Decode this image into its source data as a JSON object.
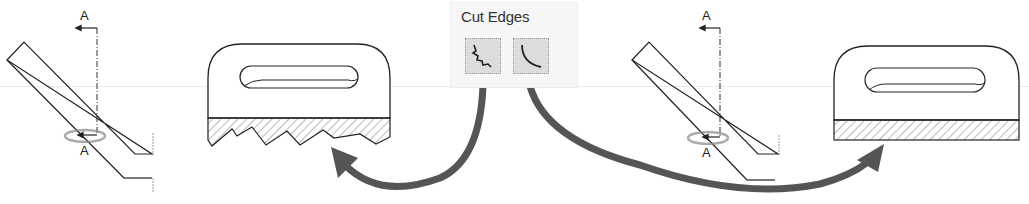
{
  "panel": {
    "title": "Cut Edges",
    "buttons": [
      {
        "name": "jagged-edge",
        "icon": "jagged-break-icon",
        "tooltip": ""
      },
      {
        "name": "smooth-edge",
        "icon": "smooth-curve-icon",
        "tooltip": ""
      }
    ]
  },
  "left_view": {
    "section_label_top": "A",
    "section_label_bottom": "A",
    "result": "jagged cut edge section"
  },
  "right_view": {
    "section_label_top": "A",
    "section_label_bottom": "A",
    "result": "smooth cut edge section"
  },
  "colors": {
    "arrow": "#555555",
    "line": "#222222",
    "panel_bg": "#f6f6f6",
    "button_bg": "#dcdcdc"
  }
}
